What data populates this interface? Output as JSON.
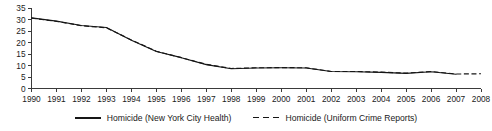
{
  "chart_data": {
    "type": "line",
    "title": "",
    "subtitle": "",
    "xlabel": "",
    "ylabel": "",
    "xlim": [
      1990,
      2008
    ],
    "ylim": [
      0,
      35
    ],
    "grid": false,
    "legend_position": "bottom-center",
    "x": [
      1990,
      1991,
      1992,
      1993,
      1994,
      1995,
      1996,
      1997,
      1998,
      1999,
      2000,
      2001,
      2002,
      2003,
      2004,
      2005,
      2006,
      2007,
      2008
    ],
    "x_tick_labels": [
      "1990",
      "1991",
      "1992",
      "1993",
      "1994",
      "1995",
      "1996",
      "1997",
      "1998",
      "1999",
      "2000",
      "2001",
      "2002",
      "2003",
      "2004",
      "2005",
      "2006",
      "2007",
      "2008"
    ],
    "y_tick_values": [
      0,
      5,
      10,
      15,
      20,
      25,
      30,
      35
    ],
    "y_tick_labels": [
      "0",
      "5",
      "10",
      "15",
      "20",
      "25",
      "30",
      "35"
    ],
    "series": [
      {
        "name": "Homicide (New York City Health)",
        "style": "solid",
        "color": "#161616",
        "x": [
          1990,
          1991,
          1992,
          1993,
          1994,
          1995,
          1996,
          1997,
          1998,
          1999,
          2000,
          2001,
          2002,
          2003,
          2004,
          2005,
          2006,
          2007
        ],
        "values": [
          30.7,
          29.3,
          27.4,
          26.5,
          21.0,
          16.1,
          13.4,
          10.4,
          8.6,
          8.9,
          9.0,
          8.9,
          7.4,
          7.3,
          7.0,
          6.6,
          7.3,
          6.2
        ]
      },
      {
        "name": "Homicide (Uniform Crime Reports)",
        "style": "dashed",
        "color": "#161616",
        "x": [
          1990,
          1991,
          1992,
          1993,
          1994,
          1995,
          1996,
          1997,
          1998,
          1999,
          2000,
          2001,
          2002,
          2003,
          2004,
          2005,
          2006,
          2007,
          2008
        ],
        "values": [
          30.6,
          29.2,
          27.3,
          26.4,
          21.1,
          16.2,
          13.4,
          10.5,
          8.7,
          9.0,
          9.1,
          9.0,
          7.4,
          7.4,
          7.1,
          6.7,
          7.4,
          6.3,
          6.4
        ]
      }
    ]
  },
  "legend": {
    "entries": [
      {
        "label": "Homicide (New York City Health)",
        "style": "solid"
      },
      {
        "label": "Homicide (Uniform Crime Reports)",
        "style": "dashed"
      }
    ]
  }
}
